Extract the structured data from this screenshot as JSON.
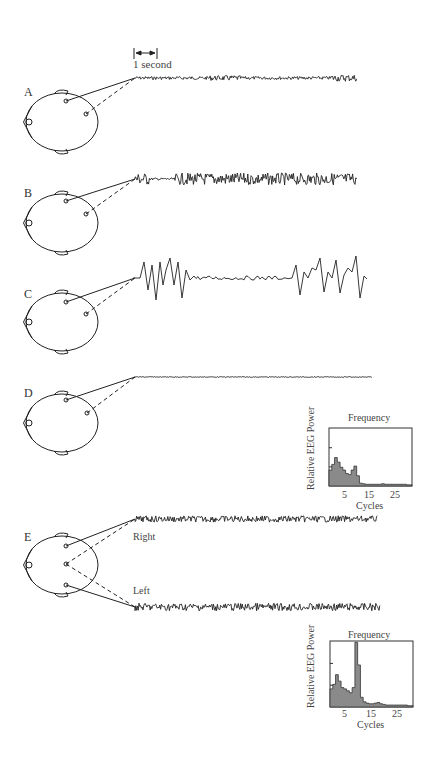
{
  "figure": {
    "scale_bar_label": "1 second",
    "panels": [
      {
        "id": "A",
        "label": "A",
        "trace_style": "low-amplitude fast activity"
      },
      {
        "id": "B",
        "label": "B",
        "trace_style": "higher-amplitude fast activity"
      },
      {
        "id": "C",
        "label": "C",
        "trace_style": "large slow spikes with flat interval"
      },
      {
        "id": "D",
        "label": "D",
        "trace_style": "nearly flat"
      },
      {
        "id": "E",
        "label": "E",
        "trace_style": "two channels",
        "channels": [
          "Right",
          "Left"
        ]
      }
    ],
    "channel_labels": {
      "right": "Right",
      "left": "Left"
    }
  },
  "chart_data": [
    {
      "type": "bar",
      "panel": "D",
      "title": "Frequency",
      "xlabel": "Cycles",
      "ylabel": "Relative EEG Power",
      "x_ticks": [
        "5",
        "15",
        "25"
      ],
      "categories": [
        1,
        2,
        3,
        4,
        5,
        6,
        7,
        8,
        9,
        10,
        11,
        12,
        13,
        14,
        15,
        16,
        17,
        18,
        19,
        20,
        21,
        22,
        23,
        24,
        25,
        26,
        27,
        28,
        29,
        30
      ],
      "values": [
        0.28,
        0.38,
        0.5,
        0.42,
        0.33,
        0.28,
        0.22,
        0.2,
        0.28,
        0.35,
        0.18,
        0.05,
        0.04,
        0.03,
        0.03,
        0.03,
        0.03,
        0.03,
        0.03,
        0.04,
        0.03,
        0.03,
        0.03,
        0.03,
        0.03,
        0.03,
        0.03,
        0.03,
        0.02,
        0.02
      ],
      "ylim": [
        0,
        1
      ],
      "grid": false
    },
    {
      "type": "bar",
      "panel": "E",
      "title": "Frequency",
      "xlabel": "Cycles",
      "ylabel": "Relative EEG Power",
      "x_ticks": [
        "5",
        "15",
        "25"
      ],
      "categories": [
        1,
        2,
        3,
        4,
        5,
        6,
        7,
        8,
        9,
        10,
        11,
        12,
        13,
        14,
        15,
        16,
        17,
        18,
        19,
        20,
        21,
        22,
        23,
        24,
        25,
        26,
        27,
        28,
        29,
        30
      ],
      "values": [
        0.28,
        0.35,
        0.5,
        0.4,
        0.3,
        0.28,
        0.25,
        0.22,
        0.3,
        1.0,
        0.65,
        0.15,
        0.08,
        0.06,
        0.05,
        0.05,
        0.06,
        0.07,
        0.05,
        0.04,
        0.03,
        0.03,
        0.03,
        0.03,
        0.03,
        0.03,
        0.03,
        0.03,
        0.02,
        0.02
      ],
      "ylim": [
        0,
        1
      ],
      "grid": false
    }
  ]
}
